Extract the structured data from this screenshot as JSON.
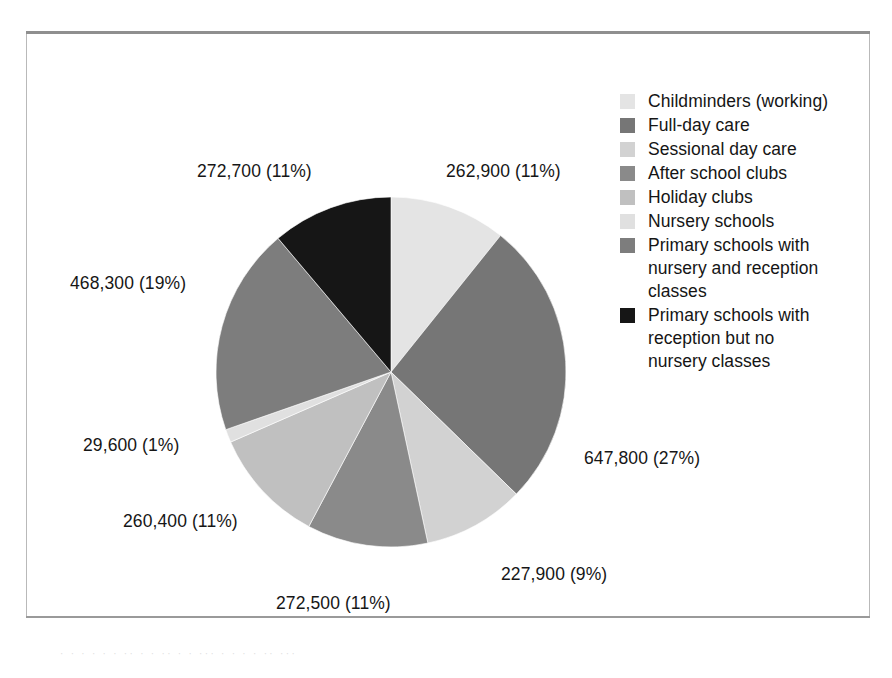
{
  "figure": {
    "background_color": "#ffffff",
    "frame_border_color": "#b9b9b9",
    "frame_rule_color": "#8f8f8f"
  },
  "chart_data": {
    "type": "pie",
    "title": "",
    "subtitle": "",
    "xlabel": "",
    "ylabel": "",
    "legend_position": "right",
    "grid": false,
    "total": 2442100,
    "start_angle_deg": 0,
    "direction": "clockwise",
    "categories": [
      "Childminders (working)",
      "Full-day care",
      "Sessional day care",
      "After school clubs",
      "Holiday clubs",
      "Nursery schools",
      "Primary schools with nursery and reception classes",
      "Primary schools with reception but no nursery classes"
    ],
    "values": [
      262900,
      647800,
      227900,
      272500,
      260400,
      29600,
      468300,
      272700
    ],
    "percents": [
      11,
      27,
      9,
      11,
      11,
      1,
      19,
      11
    ],
    "data_labels": [
      "262,900 (11%)",
      "647,800 (27%)",
      "227,900 (9%)",
      "272,500 (11%)",
      "260,400 (11%)",
      "29,600 (1%)",
      "468,300 (19%)",
      "272,700 (11%)"
    ],
    "slice_colors": [
      "#e4e4e4",
      "#767676",
      "#d2d2d2",
      "#8a8a8a",
      "#c0c0c0",
      "#e0e0e0",
      "#7d7d7d",
      "#161616"
    ]
  },
  "legend": {
    "items": [
      {
        "label": "Childminders (working)",
        "color": "#e4e4e4"
      },
      {
        "label": "Full-day care",
        "color": "#767676"
      },
      {
        "label": "Sessional day care",
        "color": "#d2d2d2"
      },
      {
        "label": "After school clubs",
        "color": "#8a8a8a"
      },
      {
        "label": "Holiday clubs",
        "color": "#c0c0c0"
      },
      {
        "label": "Nursery schools",
        "color": "#e0e0e0"
      },
      {
        "label": "Primary schools with\nnursery and reception\nclasses",
        "color": "#7d7d7d"
      },
      {
        "label": "Primary schools with\nreception but no\nnursery classes",
        "color": "#161616"
      }
    ]
  },
  "pie_labels": [
    {
      "name": "label-childminders",
      "text": "262,900 (11%)",
      "left": 419,
      "top": 131
    },
    {
      "name": "label-full-day-care",
      "text": "647,800 (27%)",
      "left": 557,
      "top": 418
    },
    {
      "name": "label-sessional",
      "text": "227,900 (9%)",
      "left": 474,
      "top": 534
    },
    {
      "name": "label-after-school",
      "text": "272,500 (11%)",
      "left": 249,
      "top": 563
    },
    {
      "name": "label-holiday-clubs",
      "text": "260,400 (11%)",
      "left": 96,
      "top": 481
    },
    {
      "name": "label-nursery-schools",
      "text": "29,600 (1%)",
      "left": 56,
      "top": 405
    },
    {
      "name": "label-primary-nursery",
      "text": "468,300 (19%)",
      "left": 43,
      "top": 243
    },
    {
      "name": "label-primary-reception",
      "text": "272,700 (11%)",
      "left": 170,
      "top": 131
    }
  ],
  "scan_bleed": {
    "text": "· ·  ·   ·    ·  ·    ··   ·      ·   ··   ·    ·    ···   ·    ·      ·    ·   ··  ···"
  }
}
